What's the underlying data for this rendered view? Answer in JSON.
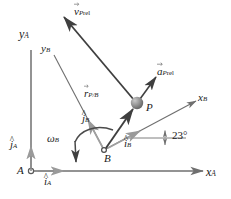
{
  "figure": {
    "angle_label": "23°",
    "points": {
      "origin_A": "A",
      "origin_B": "B",
      "particle_P": "P"
    },
    "axes": {
      "xA": {
        "letter": "x",
        "sub": "A"
      },
      "yA": {
        "letter": "y",
        "sub": "A"
      },
      "xB": {
        "letter": "x",
        "sub": "B"
      },
      "yB": {
        "letter": "y",
        "sub": "B"
      }
    },
    "unit_vectors": {
      "iA": {
        "letter": "i",
        "sub": "A"
      },
      "jA": {
        "letter": "j",
        "sub": "A"
      },
      "iB": {
        "letter": "i",
        "sub": "B"
      },
      "jB": {
        "letter": "j",
        "sub": "B"
      }
    },
    "vectors": {
      "v_rel": {
        "letter": "v",
        "sub_italic": "P",
        "sub_roman": "rel"
      },
      "a_rel": {
        "letter": "a",
        "sub_italic": "P",
        "sub_roman": "rel"
      },
      "r_PB": {
        "letter": "r",
        "sub_italic": "P",
        "slash": "/",
        "sub_italic2": "B"
      }
    },
    "omega": {
      "letter": "ω",
      "sub": "B"
    },
    "colors": {
      "dark_line": "#3f3f3f",
      "mid_line": "#6f6f6f",
      "light_line": "#9a9a9a",
      "text": "#1a1a1a",
      "particle_fill": "#8a8a8a",
      "background": "#ffffff"
    },
    "geometry": {
      "A": [
        31,
        171
      ],
      "B": [
        104,
        150
      ],
      "P": [
        137,
        103
      ],
      "xA_end": [
        207,
        171
      ],
      "yA_end": [
        31,
        47
      ],
      "xB_end": [
        200,
        99
      ],
      "yB_end": [
        51,
        50
      ],
      "v_rel_tip": [
        62,
        14
      ],
      "a_rel_tip": [
        158,
        74
      ]
    }
  }
}
